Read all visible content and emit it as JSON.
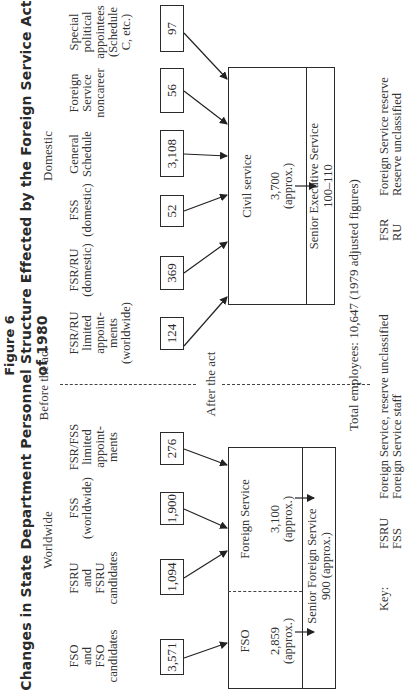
{
  "figure": {
    "label": "Figure 6",
    "title": "Changes in State Department Personnel Structure Effected by the Foreign Service Act of 1980"
  },
  "sections": {
    "before": "Before the act",
    "after": "After the act",
    "worldwide": "Worldwide",
    "domestic": "Domestic"
  },
  "worldwide_sources": [
    {
      "label": [
        "FSO",
        "and",
        "FSO",
        "candidates"
      ],
      "value": "3,571"
    },
    {
      "label": [
        "FSRU",
        "and",
        "FSRU",
        "candidates"
      ],
      "value": "1,094"
    },
    {
      "label": [
        "FSS",
        "(worldwide)"
      ],
      "value": "1,900"
    },
    {
      "label": [
        "FSR/FSS",
        "limited",
        "appoint-",
        "ments"
      ],
      "value": "276"
    }
  ],
  "domestic_sources": [
    {
      "label": [
        "FSR/RU",
        "limited",
        "appoint-",
        "ments",
        "(worldwide)"
      ],
      "value": "124"
    },
    {
      "label": [
        "FSR/RU",
        "(domestic)"
      ],
      "value": "369"
    },
    {
      "label": [
        "FSS",
        "(domestic)"
      ],
      "value": "52"
    },
    {
      "label": [
        "General",
        "Schedule"
      ],
      "value": "3,108"
    },
    {
      "label": [
        "Foreign",
        "Service",
        "noncareer"
      ],
      "value": "56"
    },
    {
      "label": [
        "Special",
        "political",
        "appointees",
        "(Schedule",
        "C, etc.)"
      ],
      "value": "97"
    }
  ],
  "foreign_service_box": {
    "fso_label": "FSO",
    "fso_value": "2,859",
    "fso_note": "(approx.)",
    "fs_label": "Foreign Service",
    "fs_value": "3,100",
    "fs_note": "(approx.)",
    "senior_label": "Senior Foreign Service",
    "senior_value": "900 (approx.)"
  },
  "civil_service_box": {
    "label": "Civil service",
    "value": "3,700",
    "note": "(approx.)",
    "senior_label": "Senior Executive Service",
    "senior_value": "100–110"
  },
  "total": "Total employees: 10,647 (1979 adjusted figures)",
  "key": {
    "heading": "Key:",
    "entries": [
      {
        "abbr": "FSRU",
        "meaning": "Foreign Service, reserve unclassified"
      },
      {
        "abbr": "FSS",
        "meaning": "Foreign Service staff"
      },
      {
        "abbr": "FSR",
        "meaning": "Foreign Service reserve"
      },
      {
        "abbr": "RU",
        "meaning": "Reserve unclassified"
      }
    ]
  }
}
